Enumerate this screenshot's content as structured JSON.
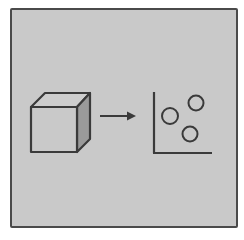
{
  "diagram": {
    "nodes": [
      {
        "id": "cube",
        "type": "3d-cube",
        "label": ""
      },
      {
        "id": "arrow",
        "type": "arrow",
        "direction": "right",
        "label": ""
      },
      {
        "id": "scatter-plot",
        "type": "scatter-plot",
        "label": "",
        "points": 3
      }
    ],
    "edges": [
      {
        "from": "cube",
        "to": "scatter-plot",
        "style": "arrow"
      }
    ]
  },
  "colors": {
    "background": "#c9c9c9",
    "stroke": "#3a3a3a",
    "cube_side": "#9a9a9a",
    "frame_border": "#4a4a4a"
  }
}
